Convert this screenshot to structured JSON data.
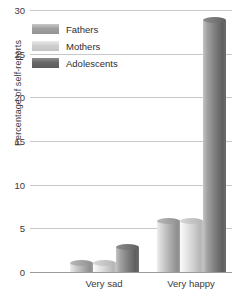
{
  "chart_data": {
    "type": "bar",
    "title": "",
    "xlabel": "",
    "ylabel": "Percentage of self-reports",
    "categories": [
      "Very sad",
      "Very happy"
    ],
    "series": [
      {
        "name": "Fathers",
        "values": [
          1.0,
          5.8
        ],
        "color": "#a8a8a8"
      },
      {
        "name": "Mothers",
        "values": [
          1.0,
          5.8
        ],
        "color": "#cdcdcd"
      },
      {
        "name": "Adolescents",
        "values": [
          2.9,
          28.9
        ],
        "color": "#7b7b7b"
      }
    ],
    "ylim": [
      0,
      30
    ],
    "yticks": [
      0,
      5,
      10,
      15,
      20,
      25,
      30
    ],
    "ytick_labels": [
      "0",
      "5",
      "10",
      "15",
      "20",
      "25",
      "30"
    ],
    "grid": true,
    "legend_position": "top-left-inside",
    "bar_style": "3d-cylinder"
  }
}
